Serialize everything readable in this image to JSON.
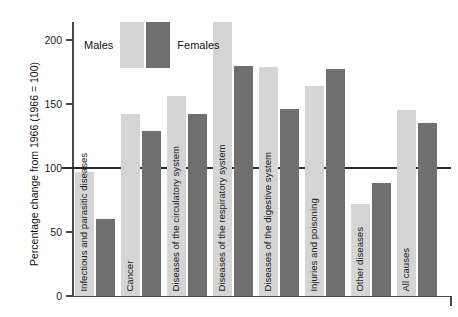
{
  "chart_data": {
    "type": "bar",
    "title": "",
    "xlabel": "",
    "ylabel": "Percentage change from 1966 (1966 = 100)",
    "ylim": [
      0,
      215
    ],
    "yticks": [
      0,
      50,
      100,
      150,
      200
    ],
    "grid": false,
    "reference_line": 100,
    "legend_position": "top-left",
    "categories": [
      "Infectious and parasitic diseases",
      "Cancer",
      "Diseases of the circulatory system",
      "Diseases of the respiratory system",
      "Diseases of the digestive system",
      "Injuries and poisoning",
      "Other diseases",
      "All causes"
    ],
    "series": [
      {
        "name": "Males",
        "color": "#d5d5d5",
        "values": [
          97,
          142,
          156,
          214,
          179,
          164,
          72,
          145
        ]
      },
      {
        "name": "Females",
        "color": "#6f6f6f",
        "values": [
          60,
          129,
          142,
          180,
          146,
          177,
          88,
          135
        ]
      }
    ]
  },
  "legend": {
    "males_label": "Males",
    "females_label": "Females"
  },
  "axis": {
    "y_title": "Percentage change from 1966 (1966 = 100)",
    "tick_labels": [
      "0",
      "50",
      "100",
      "150",
      "200"
    ]
  }
}
